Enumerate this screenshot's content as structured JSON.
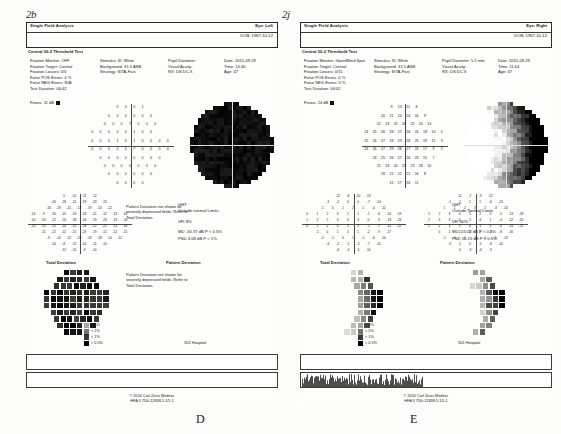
{
  "figure": {
    "marks": [
      {
        "text": "2b",
        "x": 26,
        "y": 8
      },
      {
        "text": "2j",
        "x": 282,
        "y": 8
      }
    ],
    "panel_letters": [
      {
        "text": "D",
        "x": 196,
        "y": 412
      },
      {
        "text": "E",
        "x": 410,
        "y": 412
      }
    ]
  },
  "reports": [
    {
      "id": "panel-d",
      "header": {
        "title": "Single Field Analysis",
        "eye_label": "Eye: Left",
        "dob": "DOB: 1967-10-12",
        "test_type": "Central 30-2 Threshold Test"
      },
      "params": {
        "col1": [
          "Fixation Monitor: OFF",
          "Fixation Target: Central",
          "Fixation Losses: 0/0",
          "False POS Errors: 4 %",
          "False NEG Errors: N/A",
          "Test Duration: 06:42"
        ],
        "col2": [
          "Stimulus: III, White",
          "Background: 31.5 ASB",
          "Strategy: SITA-Fast"
        ],
        "col3": [
          "Pupil Diameter:",
          "Visual Acuity:",
          "RX:    DS    DC    X"
        ],
        "col4": [
          "Date: 2015-09-29",
          "Time: 14:40",
          "Age: 47"
        ]
      },
      "fovea": "Fovea: 11 dB",
      "sensitivity_rows": [
        [
          0,
          0,
          0,
          1
        ],
        [
          0,
          0,
          0,
          0,
          0,
          0
        ],
        [
          0,
          0,
          0,
          7,
          0,
          0,
          0
        ],
        [
          0,
          0,
          0,
          0,
          0,
          1,
          0,
          0
        ],
        [
          0,
          0,
          0,
          1,
          0,
          1,
          0,
          0,
          0,
          0
        ],
        [
          0,
          0,
          0,
          0,
          0,
          7,
          0,
          0,
          0,
          0
        ],
        [
          0,
          0,
          0,
          0,
          0,
          0,
          0,
          0
        ],
        [
          0,
          0,
          0,
          0,
          0,
          0,
          0
        ],
        [
          0,
          0,
          0,
          0,
          0,
          0
        ],
        [
          0,
          0,
          0,
          0
        ]
      ],
      "total_deviation_rows": [
        [
          -5,
          -10,
          -11,
          -12
        ],
        [
          -16,
          -18,
          -22,
          -19,
          -23,
          -15
        ],
        [
          -16,
          -19,
          -21,
          -17,
          -19,
          -14,
          -12
        ],
        [
          -14,
          -9,
          -16,
          -15,
          -19,
          -23,
          -21,
          -12,
          -13,
          -16
        ],
        [
          -10,
          -13,
          -12,
          -20,
          -18,
          -16,
          -19,
          -23,
          -13,
          -16
        ],
        [
          -13,
          -13,
          -15,
          -20,
          -25,
          -18,
          -22,
          -21,
          -13,
          -16
        ],
        [
          -11,
          -12,
          -12,
          -15,
          -23,
          -19,
          -11,
          -12,
          -15
        ],
        [
          -3,
          -10,
          -12,
          -19,
          -23,
          -18,
          -14,
          -12
        ],
        [
          -10,
          -8,
          -12,
          -10,
          -11,
          -10
        ],
        [
          -12,
          -10,
          -9,
          -10
        ]
      ],
      "pattern_deviation_label": "Pattern Deviation",
      "total_deviation_label": "Total Deviation",
      "pattern_note": "Pattern Deviation not shown for severely depressed fields. Refer to Total Deviation.",
      "pattern_note_repeat": "Pattern Deviation not shown for severely depressed fields. Refer to Total Deviation.",
      "indices": {
        "ght_label": "GHT",
        "ght_value": "Outside normal Limits",
        "vfi_label": "VFI",
        "vfi_value": "8%",
        "md_label": "MD",
        "md_value": "-30.37 dB  P < 0.5%",
        "psd_label": "PSD",
        "psd_value": "4.08 dB  P < 1%"
      },
      "legend": [
        {
          "label": "< 5%",
          "density": 0.35
        },
        {
          "label": "< 2%",
          "density": 0.55
        },
        {
          "label": "< 1%",
          "density": 0.78
        },
        {
          "label": "< 0.5%",
          "density": 1.0
        }
      ],
      "hospital": "301 Hospital",
      "footer": {
        "copyright": "© 2010 Carl Zeiss Meditec",
        "model": "HFA II 750i-12838-5.1/5.1"
      }
    },
    {
      "id": "panel-e",
      "header": {
        "title": "Single Field Analysis",
        "eye_label": "Eye: Right",
        "dob": "DOB: 1967-10-12",
        "test_type": "Central 30-2 Threshold Test"
      },
      "params": {
        "col1": [
          "Fixation Monitor: Gaze/Blind Spot",
          "Fixation Target: Central",
          "Fixation Losses: 0/15",
          "False POS Errors: 0 %",
          "False NEG Errors: 0 %",
          "Test Duration: 04:02"
        ],
        "col2": [
          "Stimulus: III, White",
          "Background: 31.5 ASB",
          "Strategy: SITA-Fast"
        ],
        "col3": [
          "Pupil Diameter: 5.1 mm",
          "Visual Acuity:",
          "RX:    DS    DC    X"
        ],
        "col4": [
          "Date: 2015-09-29",
          "Time: 11:44",
          "Age: 47"
        ]
      },
      "fovea": "Fovea: 24 dB",
      "sensitivity_rows": [
        [
          9,
          13,
          11,
          8
        ],
        [
          20,
          21,
          24,
          24,
          16,
          9
        ],
        [
          22,
          23,
          25,
          26,
          25,
          20,
          13
        ],
        [
          24,
          25,
          26,
          28,
          27,
          26,
          24,
          18,
          10,
          5
        ],
        [
          25,
          26,
          27,
          28,
          29,
          28,
          25,
          19,
          11,
          3
        ],
        [
          24,
          26,
          27,
          29,
          28,
          27,
          24,
          17,
          9,
          2
        ],
        [
          23,
          25,
          26,
          27,
          26,
          23,
          15,
          7
        ],
        [
          21,
          23,
          24,
          25,
          23,
          18,
          10
        ],
        [
          18,
          21,
          22,
          21,
          16,
          8
        ],
        [
          15,
          17,
          16,
          11
        ]
      ],
      "total_deviation_rows": [
        [
          -12,
          -8,
          -10,
          -13
        ],
        [
          -3,
          -2,
          0,
          0,
          -7,
          -14
        ],
        [
          -1,
          0,
          1,
          2,
          1,
          -4,
          -11
        ],
        [
          0,
          1,
          2,
          3,
          2,
          1,
          -1,
          -6,
          -14,
          -19
        ],
        [
          1,
          2,
          2,
          3,
          4,
          3,
          0,
          -5,
          -13,
          -21
        ],
        [
          0,
          1,
          2,
          4,
          3,
          2,
          -1,
          -7,
          -15,
          -22
        ],
        [
          -1,
          0,
          1,
          2,
          1,
          -2,
          -9,
          -17
        ],
        [
          -2,
          -1,
          0,
          1,
          -1,
          -6,
          -14
        ],
        [
          -4,
          -2,
          -1,
          -2,
          -7,
          -15
        ],
        [
          -6,
          -4,
          -5,
          -10
        ]
      ],
      "pattern_deviation_rows": [
        [
          -11,
          -7,
          -9,
          -12
        ],
        [
          -1,
          -1,
          1,
          1,
          -6,
          -13
        ],
        [
          1,
          1,
          2,
          3,
          2,
          -3,
          -10
        ],
        [
          1,
          2,
          3,
          4,
          3,
          2,
          0,
          -5,
          -13,
          -18
        ],
        [
          2,
          3,
          3,
          4,
          5,
          4,
          1,
          -4,
          -12,
          -20
        ],
        [
          1,
          2,
          3,
          5,
          4,
          3,
          0,
          -6,
          -14,
          -21
        ],
        [
          0,
          1,
          2,
          3,
          2,
          -1,
          -8,
          -16
        ],
        [
          -1,
          0,
          1,
          2,
          0,
          -5,
          -13
        ],
        [
          -3,
          -1,
          0,
          -1,
          -6,
          -14
        ],
        [
          -5,
          -3,
          -4,
          -9
        ]
      ],
      "total_deviation_label": "Total Deviation",
      "pattern_deviation_label": "Pattern Deviation",
      "indices": {
        "ght_label": "GHT",
        "ght_value": "Outside Normal Limits",
        "vfi_label": "VFI",
        "vfi_value": "60%",
        "md_label": "MD",
        "md_value": "-15.02 dB  P < 0.5%",
        "psd_label": "PSD",
        "psd_value": "10.15 dB  P < 0.5%"
      },
      "legend": [
        {
          "label": "< 5%",
          "density": 0.35
        },
        {
          "label": "< 2%",
          "density": 0.55
        },
        {
          "label": "< 1%",
          "density": 0.78
        },
        {
          "label": "< 0.5%",
          "density": 1.0
        }
      ],
      "hospital": "301 Hospital",
      "footer": {
        "copyright": "© 2010 Carl Zeiss Meditec",
        "model": "HFA II 750i-12838-5.1/5.1"
      }
    }
  ]
}
